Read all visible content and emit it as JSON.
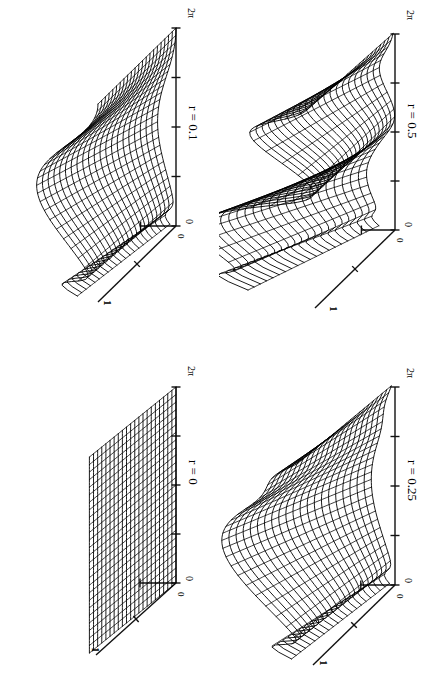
{
  "figure": {
    "background_color": "#ffffff",
    "ink_color": "#000000",
    "orientation": "rotated-90-clockwise",
    "layout": "2x2 grid of 3D wireframe surface panels"
  },
  "chart_data": {
    "type": "line",
    "title": "",
    "subtitle": "",
    "plot_kind": "3d-wireframe-surface-grid",
    "grid_rows": 2,
    "grid_cols": 2,
    "shared_axes": {
      "theta_axis": {
        "label": "",
        "ticks": [
          "0",
          "",
          "",
          "",
          "2π"
        ],
        "tick_count": 5,
        "range": [
          0,
          6.2832
        ],
        "start_label": "0",
        "end_label": "2π"
      },
      "depth_axis": {
        "label": "",
        "ticks": [
          "0",
          "",
          "1"
        ],
        "tick_count": 3,
        "range": [
          0,
          1
        ],
        "start_label": "0",
        "end_label": "1"
      },
      "height_axis": {
        "label": "",
        "ticks": [],
        "range": [
          0,
          1
        ]
      },
      "grid": false,
      "legend": "none"
    },
    "panels": [
      {
        "id": "r0",
        "position": "bottom-left",
        "param_name": "r",
        "param_value": 0,
        "label": "r = 0",
        "theta_start": "0",
        "theta_end": "2π",
        "depth_start": "0",
        "depth_end": "1",
        "description": "flat vertical sheet with a sharp step ridge near theta = 0",
        "mesh_rows": 22,
        "mesh_cols": 26,
        "amplitude": 0.0
      },
      {
        "id": "r01",
        "position": "top-left",
        "param_name": "r",
        "param_value": 0.1,
        "label": "r = 0.1",
        "theta_start": "0",
        "theta_end": "2π",
        "depth_start": "0",
        "depth_end": "1",
        "description": "single broad smooth crest, mildly undulating surface",
        "mesh_rows": 22,
        "mesh_cols": 26,
        "amplitude": 0.1
      },
      {
        "id": "r025",
        "position": "bottom-right",
        "param_name": "r",
        "param_value": 0.25,
        "label": "r = 0.25",
        "theta_start": "0",
        "theta_end": "2π",
        "depth_start": "0",
        "depth_end": "1",
        "description": "pronounced single wave with steep leading and trailing slopes",
        "mesh_rows": 22,
        "mesh_cols": 26,
        "amplitude": 0.25
      },
      {
        "id": "r05",
        "position": "top-right",
        "param_name": "r",
        "param_value": 0.5,
        "label": "r = 0.5",
        "theta_start": "0",
        "theta_end": "2π",
        "depth_start": "0",
        "depth_end": "1",
        "description": "strongly folded surface, large main lobe plus secondary twisted lobe",
        "mesh_rows": 22,
        "mesh_cols": 26,
        "amplitude": 0.5
      }
    ]
  },
  "panels": {
    "r0": {
      "param_label": "r = 0",
      "theta_zero": "0",
      "theta_max": "2π",
      "depth_zero": "0",
      "depth_max": "1"
    },
    "r01": {
      "param_label": "r = 0.1",
      "theta_zero": "0",
      "theta_max": "2π",
      "depth_zero": "0",
      "depth_max": "1"
    },
    "r025": {
      "param_label": "r = 0.25",
      "theta_zero": "0",
      "theta_max": "2π",
      "depth_zero": "0",
      "depth_max": "1"
    },
    "r05": {
      "param_label": "r = 0.5",
      "theta_zero": "0",
      "theta_max": "2π",
      "depth_zero": "0",
      "depth_max": "1"
    }
  }
}
